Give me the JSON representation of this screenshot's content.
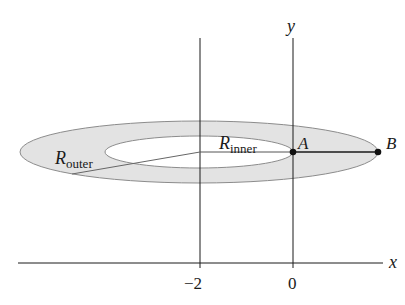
{
  "diagram": {
    "axes": {
      "x_label": "x",
      "y_label": "y",
      "ticks": [
        {
          "value": -2,
          "label": "−2"
        },
        {
          "value": 0,
          "label": "0"
        }
      ]
    },
    "points": {
      "A": {
        "label": "A"
      },
      "B": {
        "label": "B"
      }
    },
    "radii": {
      "inner": {
        "base": "R",
        "sub": "inner"
      },
      "outer": {
        "base": "R",
        "sub": "outer"
      }
    },
    "colors": {
      "ring_fill": "#e3e3e3",
      "ring_stroke": "#8c8c8c",
      "line": "#1a1a1a"
    }
  }
}
